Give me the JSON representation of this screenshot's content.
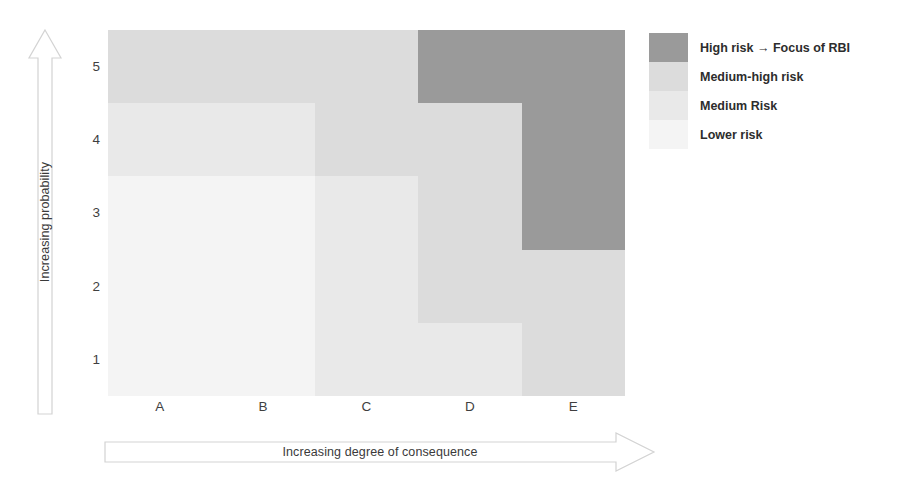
{
  "figure": {
    "yaxis_arrow_label": "Increasing probability",
    "xaxis_arrow_label": "Increasing degree of consequence"
  },
  "legend": {
    "items": [
      {
        "label": "High risk → Focus of RBI",
        "color": "#9a9a9a",
        "key": "high"
      },
      {
        "label": "Medium-high risk",
        "color": "#dcdcdc",
        "key": "medium-high"
      },
      {
        "label": "Medium Risk",
        "color": "#e9e9e9",
        "key": "medium"
      },
      {
        "label": "Lower risk",
        "color": "#f4f4f4",
        "key": "lower"
      }
    ]
  },
  "chart_data": {
    "type": "heatmap",
    "title": "",
    "xlabel": "Increasing degree of consequence",
    "ylabel": "Increasing probability",
    "categories": [
      "A",
      "B",
      "C",
      "D",
      "E"
    ],
    "xtick_labels": [
      "A",
      "B",
      "C",
      "D",
      "E"
    ],
    "ytick_labels": [
      "5",
      "4",
      "3",
      "2",
      "1"
    ],
    "y_order": "top-to-bottom",
    "grid": false,
    "legend_position": "right",
    "levels": {
      "high": {
        "label": "High risk → Focus of RBI",
        "color": "#9a9a9a",
        "rank": 4
      },
      "medium-high": {
        "label": "Medium-high risk",
        "color": "#dcdcdc",
        "rank": 3
      },
      "medium": {
        "label": "Medium Risk",
        "color": "#e9e9e9",
        "rank": 2
      },
      "lower": {
        "label": "Lower risk",
        "color": "#f4f4f4",
        "rank": 1
      }
    },
    "cells": [
      [
        {
          "x": "A",
          "y": "5",
          "level": "medium-high"
        },
        {
          "x": "B",
          "y": "5",
          "level": "medium-high"
        },
        {
          "x": "C",
          "y": "5",
          "level": "medium-high"
        },
        {
          "x": "D",
          "y": "5",
          "level": "high"
        },
        {
          "x": "E",
          "y": "5",
          "level": "high"
        }
      ],
      [
        {
          "x": "A",
          "y": "4",
          "level": "medium"
        },
        {
          "x": "B",
          "y": "4",
          "level": "medium"
        },
        {
          "x": "C",
          "y": "4",
          "level": "medium-high"
        },
        {
          "x": "D",
          "y": "4",
          "level": "medium-high"
        },
        {
          "x": "E",
          "y": "4",
          "level": "high"
        }
      ],
      [
        {
          "x": "A",
          "y": "3",
          "level": "lower"
        },
        {
          "x": "B",
          "y": "3",
          "level": "lower"
        },
        {
          "x": "C",
          "y": "3",
          "level": "medium"
        },
        {
          "x": "D",
          "y": "3",
          "level": "medium-high"
        },
        {
          "x": "E",
          "y": "3",
          "level": "high"
        }
      ],
      [
        {
          "x": "A",
          "y": "2",
          "level": "lower"
        },
        {
          "x": "B",
          "y": "2",
          "level": "lower"
        },
        {
          "x": "C",
          "y": "2",
          "level": "medium"
        },
        {
          "x": "D",
          "y": "2",
          "level": "medium-high"
        },
        {
          "x": "E",
          "y": "2",
          "level": "medium-high"
        }
      ],
      [
        {
          "x": "A",
          "y": "1",
          "level": "lower"
        },
        {
          "x": "B",
          "y": "1",
          "level": "lower"
        },
        {
          "x": "C",
          "y": "1",
          "level": "medium"
        },
        {
          "x": "D",
          "y": "1",
          "level": "medium"
        },
        {
          "x": "E",
          "y": "1",
          "level": "medium-high"
        }
      ]
    ]
  }
}
